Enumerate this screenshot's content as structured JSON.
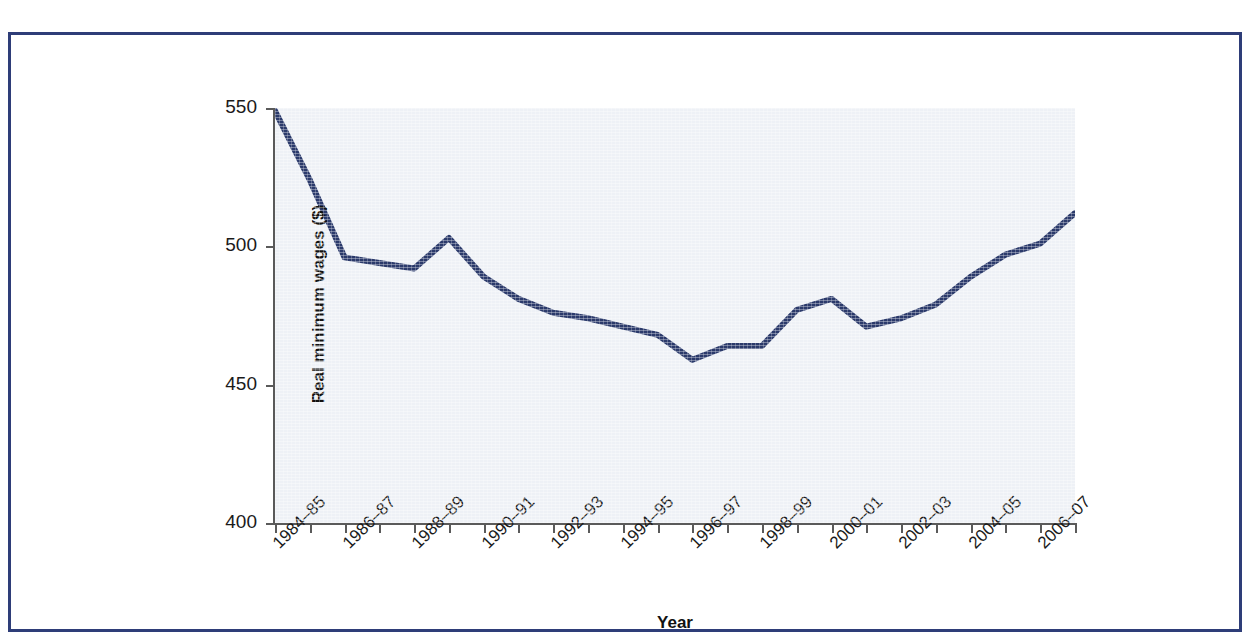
{
  "figure": {
    "frame_color": "#2e3d78",
    "plot_background": "#eef1f6",
    "line_color": "#2b3a6b"
  },
  "chart_data": {
    "type": "line",
    "title": "",
    "subtitle": "",
    "xlabel": "Year",
    "ylabel": "Real minimum wages ($)",
    "ylim": [
      400,
      550
    ],
    "yticks": [
      400,
      450,
      500,
      550
    ],
    "grid": false,
    "legend": false,
    "legend_position": "none",
    "categories": [
      "1984–85",
      "1985–86",
      "1986–87",
      "1987–88",
      "1988–89",
      "1989–90",
      "1990–91",
      "1991–92",
      "1992–93",
      "1993–94",
      "1994–95",
      "1995–96",
      "1996–97",
      "1997–98",
      "1998–99",
      "1999–00",
      "2000–01",
      "2001–02",
      "2002–03",
      "2003–04",
      "2004–05",
      "2005–06",
      "2006–07",
      "2007–08"
    ],
    "tick_labels_shown": [
      "1984–85",
      "1986–87",
      "1988–89",
      "1990–91",
      "1992–93",
      "1994–95",
      "1996–97",
      "1998–99",
      "2000–01",
      "2002–03",
      "2004–05",
      "2006–07"
    ],
    "values": [
      549,
      524,
      496,
      494,
      492,
      503,
      489,
      481,
      476,
      474,
      471,
      468,
      459,
      464,
      464,
      477,
      481,
      471,
      474,
      479,
      489,
      497,
      501,
      512
    ],
    "series": [
      {
        "name": "Real minimum wages ($)",
        "values": [
          549,
          524,
          496,
          494,
          492,
          503,
          489,
          481,
          476,
          474,
          471,
          468,
          459,
          464,
          464,
          477,
          481,
          471,
          474,
          479,
          489,
          497,
          501,
          512
        ]
      }
    ]
  },
  "caption_remnant": ""
}
